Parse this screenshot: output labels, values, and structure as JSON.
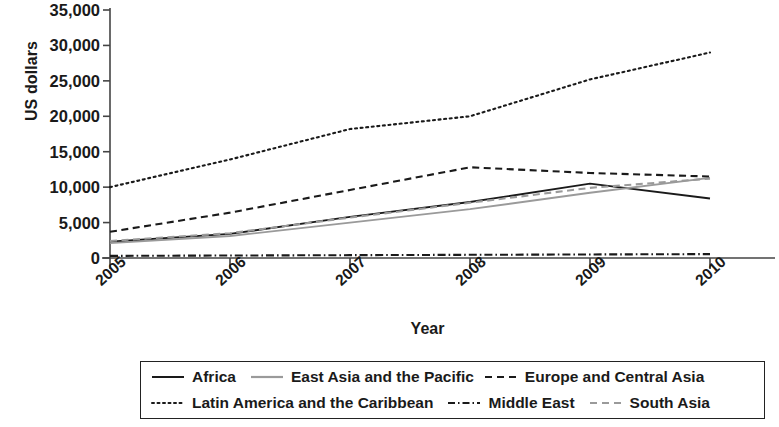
{
  "chart_data": {
    "type": "line",
    "title": "",
    "xlabel": "Year",
    "ylabel": "US dollars",
    "x": [
      2005,
      2006,
      2007,
      2008,
      2009,
      2010
    ],
    "categories": [
      "2005",
      "2006",
      "2007",
      "2008",
      "2009",
      "2010"
    ],
    "ylim": [
      0,
      35000
    ],
    "ytick_values": [
      0,
      5000,
      10000,
      15000,
      20000,
      25000,
      30000,
      35000
    ],
    "ytick_labels": [
      "0",
      "5,000",
      "10,000",
      "15,000",
      "20,000",
      "25,000",
      "30,000",
      "35,000"
    ],
    "grid": false,
    "legend_position": "bottom",
    "series": [
      {
        "name": "Africa",
        "style": "solid",
        "color": "#1a1a1a",
        "values": [
          2300,
          3400,
          5800,
          7900,
          10500,
          8400
        ]
      },
      {
        "name": "East Asia and the Pacific",
        "style": "solid",
        "color": "#9a9a9a",
        "values": [
          2100,
          3100,
          5000,
          6900,
          9200,
          11300
        ]
      },
      {
        "name": "Europe and Central Asia",
        "style": "dashed",
        "color": "#1a1a1a",
        "values": [
          3700,
          6400,
          9600,
          12800,
          12000,
          11500
        ]
      },
      {
        "name": "Latin America and the Caribbean",
        "style": "dotted",
        "color": "#1a1a1a",
        "values": [
          10000,
          13900,
          18200,
          20000,
          25200,
          29000
        ]
      },
      {
        "name": "Middle East",
        "style": "dashdot",
        "color": "#1a1a1a",
        "values": [
          300,
          350,
          400,
          450,
          500,
          550
        ]
      },
      {
        "name": "South Asia",
        "style": "dashed",
        "color": "#9a9a9a",
        "values": [
          2400,
          3500,
          5700,
          7800,
          9900,
          11200
        ]
      }
    ]
  },
  "legend": {
    "row1": [
      {
        "label": "Africa"
      },
      {
        "label": "East Asia and the Pacific"
      },
      {
        "label": "Europe and Central Asia"
      }
    ],
    "row2": [
      {
        "label": "Latin America and the Caribbean"
      },
      {
        "label": "Middle East"
      },
      {
        "label": "South Asia"
      }
    ]
  }
}
